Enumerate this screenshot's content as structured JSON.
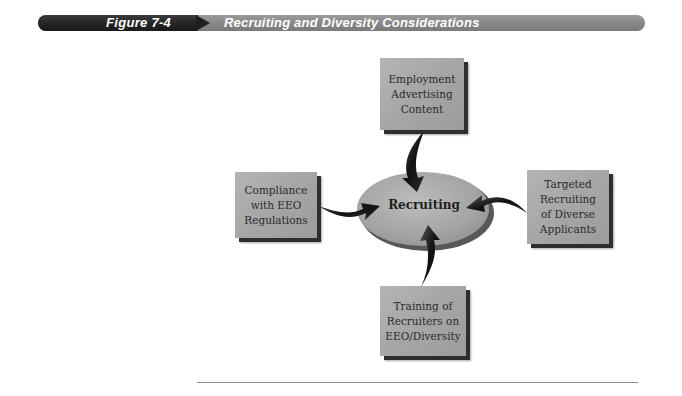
{
  "header": {
    "figure_label": "Figure 7-4",
    "title": "Recruiting and Diversity Considerations",
    "colors": {
      "dark_segment": "#222222",
      "light_segment": "#858585",
      "text": "#ffffff"
    }
  },
  "diagram": {
    "center": {
      "label": "Recruiting",
      "fill": "#a8a8a8"
    },
    "nodes": [
      {
        "id": "top",
        "position": "top",
        "lines": [
          "Employment",
          "Advertising",
          "Content"
        ]
      },
      {
        "id": "left",
        "position": "left",
        "lines": [
          "Compliance",
          "with EEO",
          "Regulations"
        ]
      },
      {
        "id": "right",
        "position": "right",
        "lines": [
          "Targeted",
          "Recruiting",
          "of Diverse",
          "Applicants"
        ]
      },
      {
        "id": "bottom",
        "position": "bottom",
        "lines": [
          "Training of",
          "Recruiters on",
          "EEO/Diversity"
        ]
      }
    ],
    "edges": [
      {
        "from": "top",
        "to": "center"
      },
      {
        "from": "left",
        "to": "center"
      },
      {
        "from": "right",
        "to": "center"
      },
      {
        "from": "bottom",
        "to": "center"
      }
    ],
    "box_fill": "#a8a8a8",
    "box_shadow": "#2e2e2e",
    "arrow_color": "#1a1a1a"
  }
}
